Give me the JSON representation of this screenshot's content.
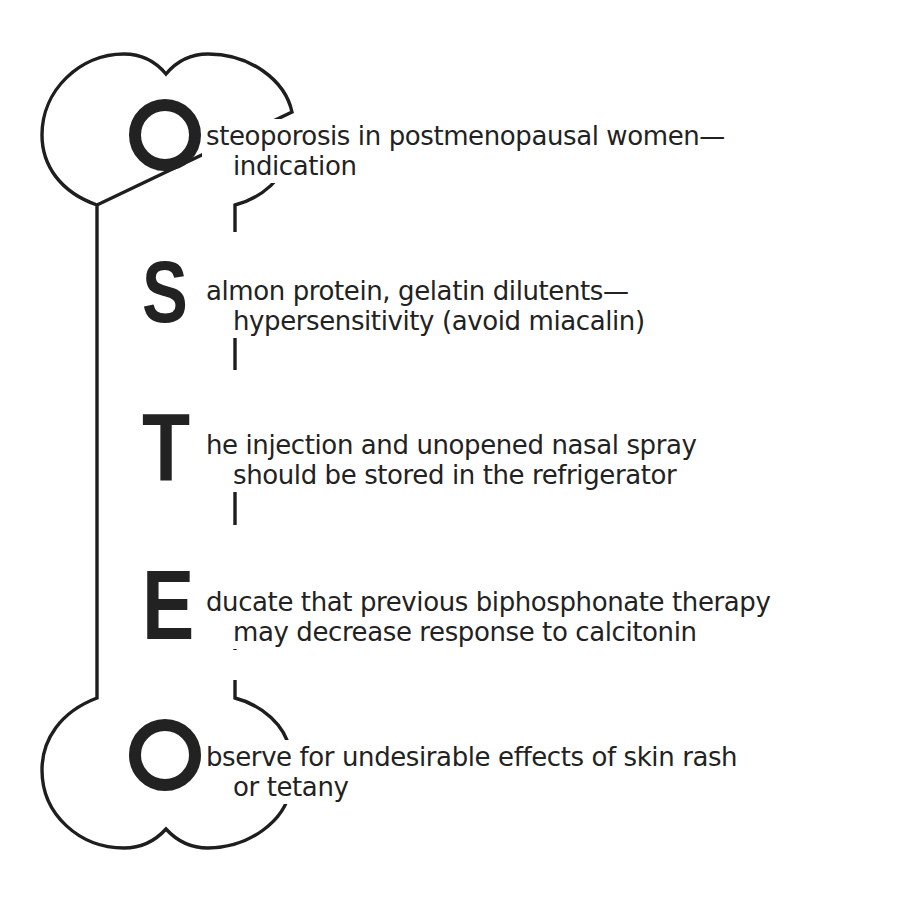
{
  "mnemonic": {
    "word": "OSTEO",
    "entries": [
      {
        "letter": "O",
        "line1": "steoporosis in postmenopausal women—",
        "line2": "indication"
      },
      {
        "letter": "S",
        "line1": "almon protein, gelatin dilutents—",
        "line2": "hypersensitivity (avoid miacalin)"
      },
      {
        "letter": "T",
        "line1": "he injection and unopened nasal spray",
        "line2": "should be stored in the refrigerator"
      },
      {
        "letter": "E",
        "line1": "ducate that previous biphosphonate therapy",
        "line2": "may decrease response to calcitonin"
      },
      {
        "letter": "O",
        "line1": "bserve for undesirable effects of skin rash",
        "line2": "or tetany"
      }
    ]
  },
  "graphic": {
    "shape": "bone-outline",
    "stroke_color": "#1e1e1e",
    "letter_color": "#222222"
  }
}
